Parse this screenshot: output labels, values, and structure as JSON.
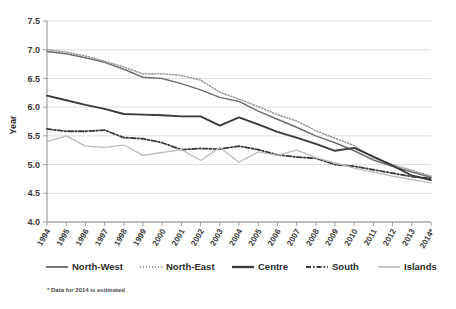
{
  "chart_data": {
    "type": "line",
    "title": "",
    "xlabel": "",
    "ylabel": "Year",
    "ylim": [
      4.0,
      7.5
    ],
    "ytick_step": 0.5,
    "yticks": [
      "7.5",
      "7.0",
      "6.5",
      "6.0",
      "5.5",
      "5.0",
      "4.5",
      "4.0"
    ],
    "grid": true,
    "legend_position": "bottom",
    "x": [
      "1994",
      "1995",
      "1996",
      "1997",
      "1998",
      "1999",
      "2000",
      "2001",
      "2002",
      "2003",
      "2004",
      "2005",
      "2006",
      "2007",
      "2008",
      "2009",
      "2010",
      "2011",
      "2012",
      "2013",
      "2014*"
    ],
    "categories": [
      "1994",
      "1995",
      "1996",
      "1997",
      "1998",
      "1999",
      "2000",
      "2001",
      "2002",
      "2003",
      "2004",
      "2005",
      "2006",
      "2007",
      "2008",
      "2009",
      "2010",
      "2011",
      "2012",
      "2013",
      "2014*"
    ],
    "series": [
      {
        "name": "North-West",
        "color": "#6e6e6e",
        "style": "solid",
        "values": [
          6.97,
          6.93,
          6.86,
          6.78,
          6.66,
          6.52,
          6.5,
          6.41,
          6.3,
          6.17,
          6.1,
          5.93,
          5.79,
          5.65,
          5.5,
          5.38,
          5.24,
          5.08,
          4.97,
          4.87,
          4.78
        ]
      },
      {
        "name": "North-East",
        "color": "#9a9a9a",
        "style": "dotted",
        "values": [
          7.0,
          6.96,
          6.89,
          6.8,
          6.7,
          6.58,
          6.58,
          6.55,
          6.47,
          6.26,
          6.14,
          6.01,
          5.87,
          5.76,
          5.59,
          5.46,
          5.33,
          5.12,
          5.0,
          4.9,
          4.8
        ]
      },
      {
        "name": "Centre",
        "color": "#3a3a3a",
        "style": "solid-bold",
        "values": [
          6.2,
          6.12,
          6.04,
          5.97,
          5.88,
          5.87,
          5.86,
          5.84,
          5.84,
          5.68,
          5.82,
          5.7,
          5.57,
          5.47,
          5.36,
          5.24,
          5.29,
          5.14,
          4.98,
          4.81,
          4.73
        ]
      },
      {
        "name": "South",
        "color": "#3a3a3a",
        "style": "dash-dot",
        "values": [
          5.62,
          5.58,
          5.58,
          5.6,
          5.47,
          5.45,
          5.38,
          5.26,
          5.28,
          5.27,
          5.32,
          5.26,
          5.17,
          5.13,
          5.11,
          5.0,
          4.97,
          4.91,
          4.85,
          4.79,
          4.76
        ]
      },
      {
        "name": "Islands",
        "color": "#bcbcbc",
        "style": "solid-light",
        "values": [
          5.4,
          5.5,
          5.32,
          5.3,
          5.34,
          5.16,
          5.21,
          5.26,
          5.07,
          5.3,
          5.04,
          5.22,
          5.16,
          5.25,
          5.12,
          5.03,
          4.94,
          4.87,
          4.8,
          4.74,
          4.68
        ]
      }
    ],
    "annotations": [
      "* Data for 2014 is estimated"
    ]
  },
  "axis": {
    "y_label": "Year",
    "y_ticks": [
      "7.5",
      "7.0",
      "6.5",
      "6.0",
      "5.5",
      "5.0",
      "4.5",
      "4.0"
    ],
    "x_ticks": [
      "1994",
      "1995",
      "1996",
      "1997",
      "1998",
      "1999",
      "2000",
      "2001",
      "2002",
      "2003",
      "2004",
      "2005",
      "2006",
      "2007",
      "2008",
      "2009",
      "2010",
      "2011",
      "2012",
      "2013",
      "2014*"
    ]
  },
  "legend": {
    "items": [
      {
        "label": "North-West",
        "color": "#6e6e6e",
        "style": "solid"
      },
      {
        "label": "North-East",
        "color": "#9a9a9a",
        "style": "dotted"
      },
      {
        "label": "Centre",
        "color": "#3a3a3a",
        "style": "solid-bold"
      },
      {
        "label": "South",
        "color": "#3a3a3a",
        "style": "dash-dot"
      },
      {
        "label": "Islands",
        "color": "#bcbcbc",
        "style": "solid-light"
      }
    ]
  },
  "footnote": {
    "text": "* Data for 2014 is estimated"
  }
}
